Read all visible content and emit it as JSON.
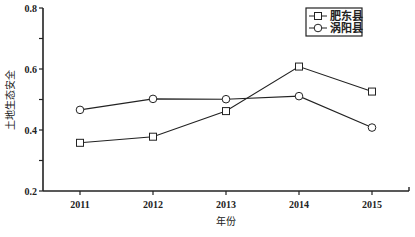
{
  "chart_data": {
    "type": "line",
    "title": "",
    "xlabel": "年份",
    "ylabel": "土地生态安全",
    "categories": [
      "2011",
      "2012",
      "2013",
      "2014",
      "2015"
    ],
    "series": [
      {
        "name": "肥东县",
        "marker": "square",
        "values": [
          0.358,
          0.378,
          0.462,
          0.608,
          0.526
        ]
      },
      {
        "name": "涡阳县",
        "marker": "circle",
        "values": [
          0.466,
          0.502,
          0.501,
          0.511,
          0.408
        ]
      }
    ],
    "ylim": [
      0.2,
      0.8
    ],
    "yticks": [
      "0.2",
      "0.4",
      "0.6",
      "0.8"
    ],
    "grid": false,
    "legend_position": "top-right"
  },
  "colors": {
    "line": "#222222",
    "marker_fill": "#ffffff"
  }
}
